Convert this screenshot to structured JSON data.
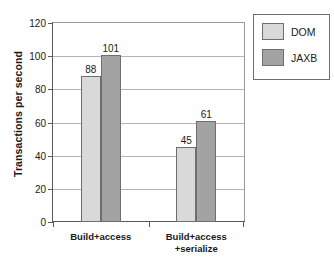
{
  "chart_data": {
    "type": "bar",
    "title": "",
    "xlabel": "",
    "ylabel": "Transactions per second",
    "ylim": [
      0,
      120
    ],
    "yticks": [
      0,
      20,
      40,
      60,
      80,
      100,
      120
    ],
    "ytick_labels": [
      "0",
      "20",
      "40",
      "60",
      "80",
      "100",
      "120"
    ],
    "categories": [
      "Build+access",
      "Build+access\n+serialize"
    ],
    "category_lines": [
      [
        "Build+access"
      ],
      [
        "Build+access",
        "+serialize"
      ]
    ],
    "series": [
      {
        "name": "DOM",
        "color": "#d9d9d9",
        "values": [
          88,
          45
        ],
        "value_labels": [
          "88",
          "45"
        ]
      },
      {
        "name": "JAXB",
        "color": "#a3a3a3",
        "values": [
          101,
          61
        ],
        "value_labels": [
          "101",
          "61"
        ]
      }
    ],
    "grid": true,
    "grid_axis": "y",
    "legend_position": "top-right",
    "bar_outline_color": "#6e6e6e",
    "axis_color": "#5a5a5a",
    "gridline_color": "#b4b4b4",
    "background": "#ffffff"
  }
}
